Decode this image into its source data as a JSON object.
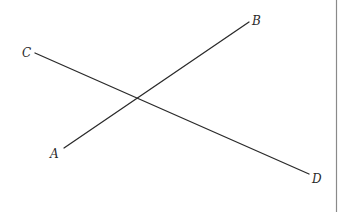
{
  "diagram": {
    "type": "intersecting-line-segments",
    "colors": {
      "line": "#2a2a2a",
      "label": "#2a2a2a",
      "border": "#8a8a8a",
      "background": "#ffffff"
    },
    "points": {
      "A": {
        "label": "A",
        "x": 64,
        "y": 148,
        "label_x": 50,
        "label_y": 158
      },
      "B": {
        "label": "B",
        "x": 249,
        "y": 22,
        "label_x": 252,
        "label_y": 25
      },
      "C": {
        "label": "C",
        "x": 35,
        "y": 53,
        "label_x": 22,
        "label_y": 57
      },
      "D": {
        "label": "D",
        "x": 309,
        "y": 174,
        "label_x": 312,
        "label_y": 183
      }
    },
    "segments": [
      {
        "name": "AB",
        "from": "A",
        "to": "B"
      },
      {
        "name": "CD",
        "from": "C",
        "to": "D"
      }
    ],
    "intersection": {
      "x": 137,
      "y": 98
    },
    "right_border": {
      "x": 336.5,
      "y1": 0,
      "y2": 212
    }
  }
}
